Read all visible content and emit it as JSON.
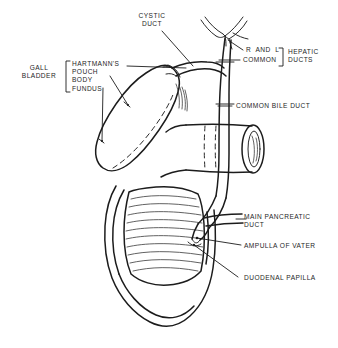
{
  "figure": {
    "background_color": "#ffffff",
    "ink_color": "#1c1c1c",
    "text_color": "#262626",
    "width": 338,
    "height": 348
  },
  "labels": {
    "gall_bladder": "GALL\nBLADDER",
    "hartmanns_pouch": "HARTMANN'S\nPOUCH",
    "body": "BODY",
    "fundus": "FUNDUS",
    "cystic_duct": "CYSTIC\nDUCT",
    "r_and_l": "R  AND  L",
    "common": "COMMON",
    "hepatic_ducts": "HEPATIC\nDUCTS",
    "common_bile_duct": "COMMON BILE DUCT",
    "main_pancreatic_duct": "MAIN PANCREATIC\nDUCT",
    "ampulla_of_vater": "AMPULLA OF VATER",
    "duodenal_papilla": "DUODENAL PAPILLA"
  },
  "structures": [
    "gallbladder",
    "cystic-duct",
    "right-and-left-hepatic-ducts",
    "common-hepatic-duct",
    "common-bile-duct",
    "duodenum",
    "duodenal-mucosal-folds",
    "main-pancreatic-duct",
    "ampulla-of-vater",
    "duodenal-papilla"
  ]
}
